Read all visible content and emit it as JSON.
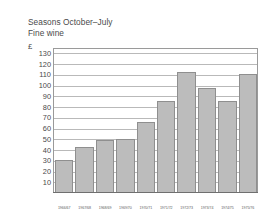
{
  "figure": {
    "title_lines": [
      "Seasons October–July",
      "Fine wine"
    ],
    "unit_label": "£",
    "grid_color": "#b9b9b9",
    "bar_fill": "#bcbcbc",
    "bar_stroke": "#8f8f8f"
  },
  "chart_data": {
    "type": "bar",
    "title": "Seasons October–July",
    "subtitle": "Fine wine",
    "xlabel": "",
    "ylabel": "£",
    "ylim": [
      0,
      135
    ],
    "grid": true,
    "legend": "none",
    "categories": [
      "1966/67",
      "1967/68",
      "1968/69",
      "1969/70",
      "1970/71",
      "1971/72",
      "1972/73",
      "1973/74",
      "1974/75",
      "1975/76"
    ],
    "values": [
      30,
      42,
      48,
      49,
      65,
      85,
      112,
      97,
      85,
      110
    ],
    "yticks": [
      130,
      120,
      110,
      100,
      90,
      80,
      70,
      60,
      50,
      40,
      30,
      20,
      10
    ],
    "ytick_labels": [
      "130",
      "120",
      "110",
      "100",
      "90",
      "80",
      "70",
      "60",
      "50",
      "40",
      "30",
      "20",
      "10"
    ]
  }
}
